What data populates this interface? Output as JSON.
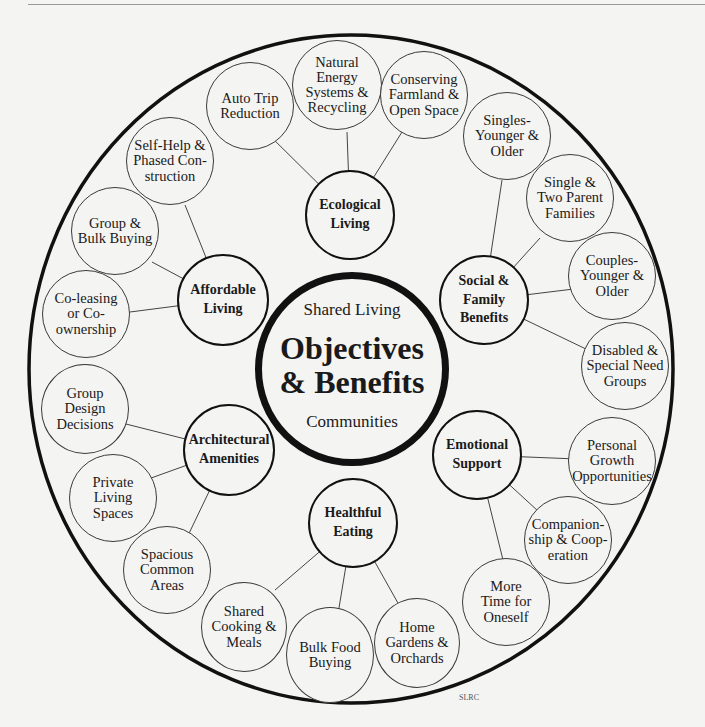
{
  "diagram": {
    "center": {
      "top_label": "Shared Living",
      "title": "Objectives\n& Benefits",
      "bottom_label": "Communities"
    },
    "categories": [
      {
        "id": "ecological",
        "label": "Ecological\nLiving"
      },
      {
        "id": "social",
        "label": "Social &\nFamily\nBenefits"
      },
      {
        "id": "emotional",
        "label": "Emotional\nSupport"
      },
      {
        "id": "healthful",
        "label": "Healthful\nEating"
      },
      {
        "id": "architectural",
        "label": "Architectural\nAmenities"
      },
      {
        "id": "affordable",
        "label": "Affordable\nLiving"
      }
    ],
    "details": [
      {
        "category": "ecological",
        "label": "Auto Trip\nReduction"
      },
      {
        "category": "ecological",
        "label": "Natural\nEnergy\nSystems &\nRecycling"
      },
      {
        "category": "ecological",
        "label": "Conserving\nFarmland &\nOpen Space"
      },
      {
        "category": "social",
        "label": "Singles-\nYounger &\nOlder"
      },
      {
        "category": "social",
        "label": "Single &\nTwo Parent\nFamilies"
      },
      {
        "category": "social",
        "label": "Couples-\nYounger &\nOlder"
      },
      {
        "category": "social",
        "label": "Disabled &\nSpecial Need\nGroups"
      },
      {
        "category": "emotional",
        "label": "Personal\nGrowth\nOpportunities"
      },
      {
        "category": "emotional",
        "label": "Companion-\nship & Coop-\neration"
      },
      {
        "category": "emotional",
        "label": "More\nTime for\nOneself"
      },
      {
        "category": "healthful",
        "label": "Home\nGardens &\nOrchards"
      },
      {
        "category": "healthful",
        "label": "Bulk Food\nBuying"
      },
      {
        "category": "healthful",
        "label": "Shared\nCooking &\nMeals"
      },
      {
        "category": "architectural",
        "label": "Spacious\nCommon\nAreas"
      },
      {
        "category": "architectural",
        "label": "Private\nLiving\nSpaces"
      },
      {
        "category": "architectural",
        "label": "Group\nDesign\nDecisions"
      },
      {
        "category": "affordable",
        "label": "Co-leasing\nor Co-\nownership"
      },
      {
        "category": "affordable",
        "label": "Group &\nBulk Buying"
      },
      {
        "category": "affordable",
        "label": "Self-Help &\nPhased Con-\nstruction"
      }
    ],
    "credit": "SLRC"
  }
}
